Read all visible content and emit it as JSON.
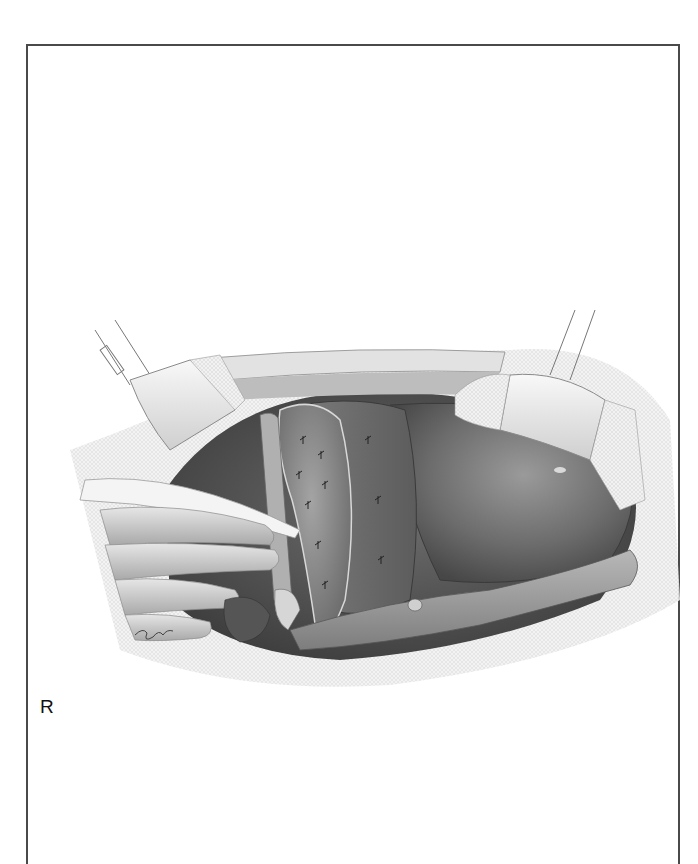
{
  "figure": {
    "orientation_label": "R",
    "artist_signature": "signature",
    "colors": {
      "frame": "#4a4a4a",
      "background": "#ffffff",
      "organ_dark": "#5a5a5a",
      "organ_mid": "#8a8a8a",
      "organ_light": "#c8c8c8",
      "drape": "#e8e8e8"
    }
  }
}
